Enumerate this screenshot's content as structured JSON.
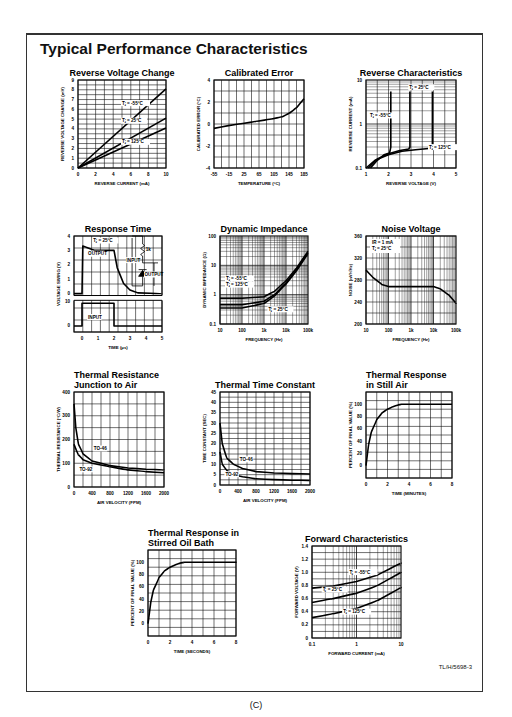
{
  "page": {
    "title": "Typical Performance Characteristics",
    "reference": "TL/H/5698-3",
    "caption": "(C)"
  },
  "chart_data": [
    {
      "id": "reverse-voltage-change",
      "type": "line",
      "title": "Reverse Voltage Change",
      "xlabel": "REVERSE CURRENT (mA)",
      "ylabel": "REVERSE VOLTAGE CHANGE (mV)",
      "xlim": [
        0,
        10
      ],
      "ylim": [
        0,
        9
      ],
      "xticks": [
        "0",
        "2",
        "4",
        "6",
        "8",
        "10"
      ],
      "yticks": [
        "0",
        "1",
        "2",
        "3",
        "4",
        "5",
        "6",
        "7",
        "8",
        "9"
      ],
      "grid": true,
      "series": [
        {
          "name": "TJ = -55°C",
          "x": [
            0,
            10
          ],
          "y": [
            0,
            8.1
          ]
        },
        {
          "name": "TJ = 25°C",
          "x": [
            0,
            10
          ],
          "y": [
            0,
            5.1
          ]
        },
        {
          "name": "TJ = 125°C",
          "x": [
            0,
            10
          ],
          "y": [
            0,
            4.1
          ]
        }
      ]
    },
    {
      "id": "calibrated-error",
      "type": "line",
      "title": "Calibrated Error",
      "xlabel": "TEMPERATURE (°C)",
      "ylabel": "CALIBRATED ERROR (°C)",
      "xlim": [
        -55,
        195
      ],
      "ylim": [
        -4,
        4
      ],
      "xticks": [
        "-55",
        "-15",
        "25",
        "65",
        "105",
        "145",
        "185"
      ],
      "yticks": [
        "-4",
        "-2",
        "0",
        "2",
        "4"
      ],
      "grid": true,
      "series": [
        {
          "name": "Error",
          "x": [
            -55,
            -15,
            25,
            65,
            105,
            135,
            155,
            175,
            195
          ],
          "y": [
            -0.4,
            -0.15,
            0.05,
            0.25,
            0.45,
            0.65,
            1.0,
            1.5,
            2.3
          ]
        }
      ]
    },
    {
      "id": "reverse-characteristics",
      "type": "line",
      "scale": "semilogy",
      "title": "Reverse Characteristics",
      "xlabel": "REVERSE VOLTAGE (V)",
      "ylabel": "REVERSE CURRENT (mA)",
      "xlim": [
        1,
        5
      ],
      "ylim": [
        0.1,
        10
      ],
      "xticks": [
        "1",
        "2",
        "3",
        "4",
        "5"
      ],
      "yticks": [
        "0.1",
        "1",
        "10"
      ],
      "grid": true,
      "series": [
        {
          "name": "TJ = -55°C",
          "x": [
            1.2,
            1.5,
            1.8,
            2.05,
            2.1,
            2.1
          ],
          "y": [
            0.1,
            0.15,
            0.2,
            0.22,
            0.3,
            5.5
          ]
        },
        {
          "name": "TJ = 25°C",
          "x": [
            1.1,
            1.5,
            2.0,
            2.5,
            2.9,
            2.95,
            2.95
          ],
          "y": [
            0.1,
            0.16,
            0.21,
            0.25,
            0.27,
            0.3,
            5.5
          ]
        },
        {
          "name": "TJ = 125°C",
          "x": [
            1.0,
            1.4,
            2.0,
            2.6,
            3.2,
            3.9,
            3.95,
            3.95
          ],
          "y": [
            0.1,
            0.15,
            0.2,
            0.24,
            0.26,
            0.28,
            0.3,
            5.5
          ]
        }
      ]
    },
    {
      "id": "response-time",
      "type": "line",
      "title": "Response Time",
      "xlabel": "TIME (µs)",
      "ylabel": "VOLTAGE SWING (V)",
      "xlim": [
        -0.5,
        5
      ],
      "ylim": [
        0,
        4
      ],
      "xticks": [
        "0",
        "1",
        "2",
        "3",
        "4",
        "5"
      ],
      "yticks_upper": [
        "0",
        "1",
        "2",
        "3",
        "4"
      ],
      "yticks_lower": [
        "0",
        "10"
      ],
      "grid": true,
      "annotations": [
        "TJ = 25°C",
        "OUTPUT",
        "INPUT",
        "1k",
        "INPUT",
        "OUTPUT"
      ],
      "series": [
        {
          "name": "OUTPUT",
          "x": [
            -0.5,
            0,
            0.05,
            0.3,
            0.8,
            2.0,
            2.2,
            2.6,
            3.0,
            3.5,
            5.0
          ],
          "y": [
            0,
            0,
            3.3,
            3.2,
            3.0,
            3.0,
            1.8,
            0.7,
            0.25,
            0.05,
            0
          ]
        },
        {
          "name": "INPUT",
          "x": [
            -0.5,
            0,
            0,
            2,
            2,
            5
          ],
          "y": [
            0,
            0,
            10,
            10,
            0,
            0
          ]
        }
      ]
    },
    {
      "id": "dynamic-impedance",
      "type": "line",
      "scale": "loglog",
      "title": "Dynamic Impedance",
      "xlabel": "FREQUENCY (Hz)",
      "ylabel": "DYNAMIC IMPEDANCE (Ω)",
      "xlim": [
        10,
        100000
      ],
      "ylim": [
        0.1,
        100
      ],
      "xticks": [
        "10",
        "100",
        "1k",
        "10k",
        "100k"
      ],
      "yticks": [
        "0.1",
        "1",
        "10",
        "100"
      ],
      "grid": true,
      "series": [
        {
          "name": "TJ = -55°C",
          "x": [
            10,
            100,
            1000,
            3000,
            10000,
            30000,
            100000
          ],
          "y": [
            0.75,
            0.75,
            0.85,
            1.3,
            3,
            8,
            30
          ]
        },
        {
          "name": "TJ = 125°C",
          "x": [
            10,
            100,
            1000,
            3000,
            10000,
            30000,
            100000
          ],
          "y": [
            0.45,
            0.45,
            0.6,
            1.0,
            2.5,
            7,
            27
          ]
        },
        {
          "name": "TJ = 25°C",
          "x": [
            10,
            100,
            1000,
            3000,
            10000,
            30000,
            100000
          ],
          "y": [
            0.35,
            0.35,
            0.5,
            0.9,
            2.3,
            6.5,
            25
          ]
        }
      ]
    },
    {
      "id": "noise-voltage",
      "type": "line",
      "scale": "semilogx",
      "title": "Noise Voltage",
      "xlabel": "FREQUENCY (Hz)",
      "ylabel": "NOISE (nV/√Hz)",
      "xlim": [
        10,
        100000
      ],
      "ylim": [
        200,
        360
      ],
      "xticks": [
        "10",
        "100",
        "1k",
        "10k",
        "100k"
      ],
      "yticks": [
        "200",
        "240",
        "280",
        "320",
        "360"
      ],
      "grid": true,
      "annotations": [
        "IR = 1 mA",
        "TJ = 25°C"
      ],
      "series": [
        {
          "name": "Noise",
          "x": [
            10,
            20,
            50,
            100,
            1000,
            10000,
            20000,
            50000,
            100000
          ],
          "y": [
            298,
            285,
            272,
            268,
            268,
            268,
            264,
            252,
            238
          ]
        }
      ]
    },
    {
      "id": "thermal-resistance-junction-to-air",
      "type": "line",
      "title": "Thermal Resistance Junction to Air",
      "xlabel": "AIR VELOCITY (FPM)",
      "ylabel": "THERMAL RESISTANCE (°C/W)",
      "xlim": [
        0,
        2000
      ],
      "ylim": [
        0,
        400
      ],
      "xticks": [
        "0",
        "400",
        "800",
        "1200",
        "1600",
        "2000"
      ],
      "yticks": [
        "0",
        "100",
        "200",
        "300",
        "400"
      ],
      "grid": true,
      "series": [
        {
          "name": "TO-46",
          "x": [
            0,
            40,
            100,
            200,
            400,
            800,
            1200,
            1600,
            2000
          ],
          "y": [
            350,
            250,
            180,
            140,
            110,
            90,
            80,
            75,
            72
          ]
        },
        {
          "name": "TO-92",
          "x": [
            0,
            40,
            100,
            200,
            400,
            800,
            1200,
            1600,
            2000
          ],
          "y": [
            180,
            160,
            135,
            115,
            100,
            85,
            72,
            65,
            60
          ]
        }
      ]
    },
    {
      "id": "thermal-time-constant",
      "type": "line",
      "title": "Thermal Time Constant",
      "xlabel": "AIR VELOCITY (FPM)",
      "ylabel": "TIME CONSTANT (SEC)",
      "xlim": [
        0,
        2000
      ],
      "ylim": [
        0,
        45
      ],
      "xticks": [
        "0",
        "400",
        "800",
        "1200",
        "1600",
        "2000"
      ],
      "yticks": [
        "0",
        "5",
        "10",
        "15",
        "20",
        "25",
        "30",
        "35",
        "40",
        "45"
      ],
      "grid": true,
      "series": [
        {
          "name": "TO-46",
          "x": [
            0,
            50,
            150,
            300,
            500,
            800,
            1200,
            1600,
            2000
          ],
          "y": [
            30,
            20,
            13,
            10,
            8,
            6.5,
            5.8,
            5.5,
            5.3
          ]
        },
        {
          "name": "TO-92",
          "x": [
            0,
            50,
            150,
            300,
            500,
            800,
            1200,
            1600,
            2000
          ],
          "y": [
            16,
            10,
            7,
            5,
            4,
            3,
            2.6,
            2.3,
            2.2
          ]
        }
      ]
    },
    {
      "id": "thermal-response-still-air",
      "type": "line",
      "title": "Thermal Response in Still Air",
      "xlabel": "TIME (MINUTES)",
      "ylabel": "PERCENT OF FINAL VALUE (%)",
      "xlim": [
        0,
        8
      ],
      "ylim": [
        -20,
        120
      ],
      "xticks": [
        "0",
        "2",
        "4",
        "6",
        "8"
      ],
      "yticks": [
        "0",
        "20",
        "40",
        "60",
        "80",
        "100"
      ],
      "grid": true,
      "series": [
        {
          "name": "Response",
          "x": [
            0,
            0.25,
            0.5,
            1,
            1.5,
            2,
            2.5,
            3,
            3.3,
            8
          ],
          "y": [
            0,
            35,
            55,
            75,
            86,
            92,
            96,
            99,
            100,
            100
          ]
        }
      ]
    },
    {
      "id": "thermal-response-stirred-oil-bath",
      "type": "line",
      "title": "Thermal Response in Stirred Oil Bath",
      "xlabel": "TIME (SECONDS)",
      "ylabel": "PERCENT OF FINAL VALUE (%)",
      "xlim": [
        0,
        8
      ],
      "ylim": [
        -20,
        120
      ],
      "xticks": [
        "0",
        "2",
        "4",
        "6",
        "8"
      ],
      "yticks": [
        "0",
        "20",
        "40",
        "60",
        "80",
        "100"
      ],
      "grid": true,
      "series": [
        {
          "name": "Response",
          "x": [
            0,
            0.25,
            0.5,
            1,
            1.5,
            2,
            2.5,
            3,
            3.3,
            8
          ],
          "y": [
            0,
            35,
            55,
            75,
            86,
            92,
            96,
            99,
            100,
            100
          ]
        }
      ]
    },
    {
      "id": "forward-characteristics",
      "type": "line",
      "scale": "semilogx",
      "title": "Forward Characteristics",
      "xlabel": "FORWARD CURRENT (mA)",
      "ylabel": "FORWARD VOLTAGE (V)",
      "xlim": [
        0.1,
        10
      ],
      "ylim": [
        0,
        1.4
      ],
      "xticks": [
        "0.1",
        "1",
        "10"
      ],
      "yticks": [
        "0",
        "0.2",
        "0.4",
        "0.6",
        "0.8",
        "1.0",
        "1.2",
        "1.4"
      ],
      "grid": true,
      "series": [
        {
          "name": "TJ = -55°C",
          "x": [
            0.1,
            0.3,
            1,
            3,
            10
          ],
          "y": [
            0.76,
            0.79,
            0.86,
            0.96,
            1.14
          ]
        },
        {
          "name": "TJ = 25°C",
          "x": [
            0.1,
            0.3,
            1,
            3,
            10
          ],
          "y": [
            0.54,
            0.6,
            0.68,
            0.8,
            1.0
          ]
        },
        {
          "name": "TJ = 125°C",
          "x": [
            0.1,
            0.3,
            1,
            3,
            10
          ],
          "y": [
            0.31,
            0.37,
            0.45,
            0.57,
            0.77
          ]
        }
      ]
    }
  ]
}
